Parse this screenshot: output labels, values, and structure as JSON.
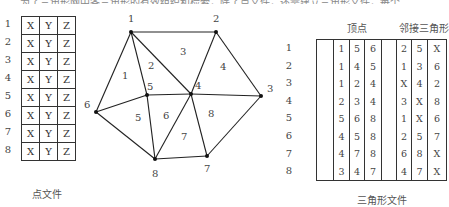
{
  "top_text_cut": "……为了三角形网中各三角形的有效组织和检索，除了点文件，还需建立三角形文件，每个",
  "point_file": {
    "caption": "点文件",
    "rows": [
      {
        "id": "1",
        "cols": [
          "X",
          "Y",
          "Z"
        ]
      },
      {
        "id": "2",
        "cols": [
          "X",
          "Y",
          "Z"
        ]
      },
      {
        "id": "3",
        "cols": [
          "X",
          "Y",
          "Z"
        ]
      },
      {
        "id": "4",
        "cols": [
          "X",
          "Y",
          "Z"
        ]
      },
      {
        "id": "5",
        "cols": [
          "X",
          "Y",
          "Z"
        ]
      },
      {
        "id": "6",
        "cols": [
          "X",
          "Y",
          "Z"
        ]
      },
      {
        "id": "7",
        "cols": [
          "X",
          "Y",
          "Z"
        ]
      },
      {
        "id": "8",
        "cols": [
          "X",
          "Y",
          "Z"
        ]
      }
    ]
  },
  "mesh": {
    "nodes": [
      {
        "id": "1",
        "x": 131,
        "y": 32
      },
      {
        "id": "2",
        "x": 216,
        "y": 32
      },
      {
        "id": "3",
        "x": 261,
        "y": 96
      },
      {
        "id": "4",
        "x": 191,
        "y": 94
      },
      {
        "id": "5",
        "x": 147,
        "y": 95
      },
      {
        "id": "6",
        "x": 96,
        "y": 112
      },
      {
        "id": "7",
        "x": 207,
        "y": 156
      },
      {
        "id": "8",
        "x": 155,
        "y": 159
      }
    ],
    "triangles": [
      {
        "id": "1",
        "label_x": 122,
        "label_y": 79
      },
      {
        "id": "2",
        "label_x": 148,
        "label_y": 69
      },
      {
        "id": "3",
        "label_x": 180,
        "label_y": 55
      },
      {
        "id": "4",
        "label_x": 220,
        "label_y": 70
      },
      {
        "id": "5",
        "label_x": 135,
        "label_y": 121
      },
      {
        "id": "6",
        "label_x": 163,
        "label_y": 119
      },
      {
        "id": "7",
        "label_x": 181,
        "label_y": 140
      },
      {
        "id": "8",
        "label_x": 208,
        "label_y": 117
      }
    ]
  },
  "triangle_file": {
    "caption": "三角形文件",
    "header_vertices": "顶点",
    "header_adjacent": "邻接三角形",
    "rows": [
      {
        "id": "1",
        "vertices": [
          "1",
          "5",
          "6"
        ],
        "adjacent": [
          "2",
          "5",
          "X"
        ]
      },
      {
        "id": "2",
        "vertices": [
          "1",
          "4",
          "5"
        ],
        "adjacent": [
          "1",
          "3",
          "6"
        ]
      },
      {
        "id": "3",
        "vertices": [
          "1",
          "2",
          "4"
        ],
        "adjacent": [
          "X",
          "4",
          "2"
        ]
      },
      {
        "id": "4",
        "vertices": [
          "2",
          "3",
          "4"
        ],
        "adjacent": [
          "3",
          "X",
          "8"
        ]
      },
      {
        "id": "5",
        "vertices": [
          "5",
          "6",
          "8"
        ],
        "adjacent": [
          "1",
          "X",
          "6"
        ]
      },
      {
        "id": "6",
        "vertices": [
          "4",
          "5",
          "8"
        ],
        "adjacent": [
          "2",
          "5",
          "7"
        ]
      },
      {
        "id": "7",
        "vertices": [
          "4",
          "7",
          "8"
        ],
        "adjacent": [
          "6",
          "8",
          "X"
        ]
      },
      {
        "id": "8",
        "vertices": [
          "3",
          "4",
          "7"
        ],
        "adjacent": [
          "4",
          "7",
          "X"
        ]
      }
    ]
  }
}
